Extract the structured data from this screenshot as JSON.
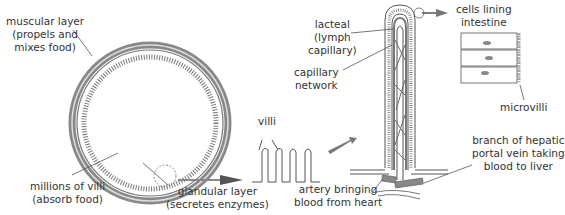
{
  "labels": {
    "muscular_layer": "muscular layer\n(propels and\nmixes food)",
    "millions_of_villi": "millions of villi\n(absorb food)",
    "glandular_layer": "glandular layer\n(secretes enzymes)",
    "villi": "villi",
    "lacteal": "lacteal\n(lymph\ncapillary)",
    "capillary_network": "capillary\nnetwork",
    "artery": "artery bringing\nblood from heart",
    "cells_lining": "cells lining\nintestine",
    "microvilli": "microvilli",
    "hepatic_vein": "branch of hepatic\nportal vein taking\nblood to liver"
  },
  "colors": {
    "line": "#555555",
    "fill_gray": "#9a9a9a",
    "arrow": "#6a6a6a"
  }
}
